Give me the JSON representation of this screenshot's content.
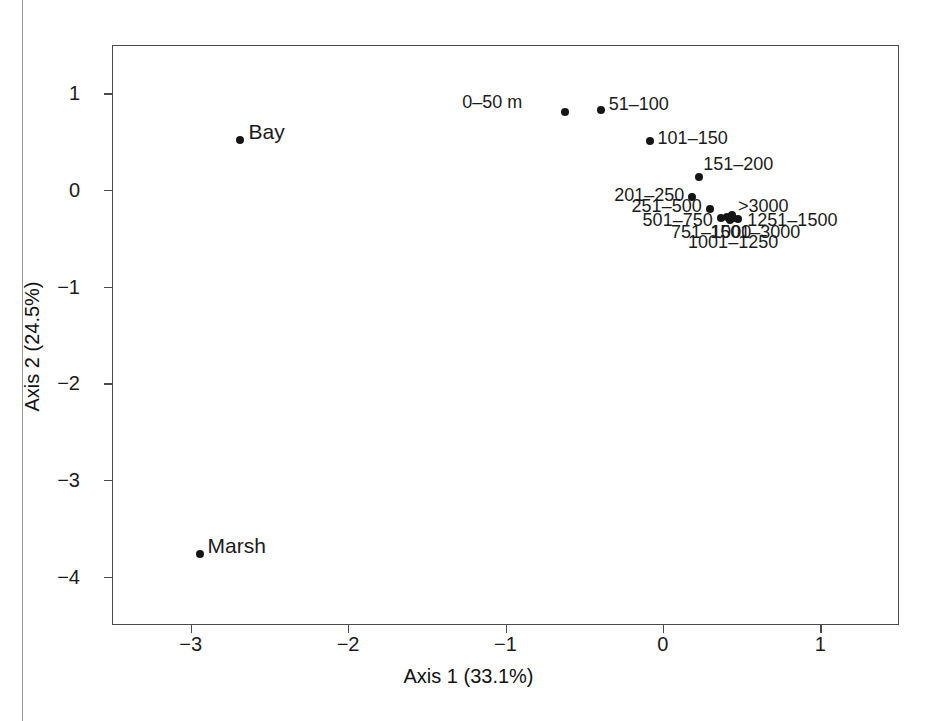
{
  "figure": {
    "background_color": "#ffffff",
    "frame_color": "#4a4a4a",
    "point_color": "#151515"
  },
  "chart_data": {
    "type": "scatter",
    "title": "",
    "xlabel": "Axis 1 (33.1%)",
    "ylabel": "Axis 2 (24.5%)",
    "xlim": [
      -3.5,
      1.5
    ],
    "ylim": [
      -4.5,
      1.5
    ],
    "xticks": [
      -3,
      -2,
      -1,
      0,
      1
    ],
    "xticklabels": [
      "−3",
      "−2",
      "−1",
      "0",
      "1"
    ],
    "yticks": [
      1,
      0,
      -1,
      -2,
      -3,
      -4
    ],
    "yticklabels": [
      "1",
      "0",
      "−1",
      "−2",
      "−3",
      "−4"
    ],
    "grid": false,
    "legend": false,
    "points": [
      {
        "label": "Bay",
        "x": -2.69,
        "y": 0.53,
        "label_pos": "right"
      },
      {
        "label": "Marsh",
        "x": -2.95,
        "y": -3.76,
        "label_pos": "right"
      },
      {
        "label": "0–50 m",
        "x": -0.63,
        "y": 0.82,
        "label_pos": "left"
      },
      {
        "label": "51–100",
        "x": -0.4,
        "y": 0.84,
        "label_pos": "right"
      },
      {
        "label": "101–150",
        "x": -0.09,
        "y": 0.52,
        "label_pos": "right"
      },
      {
        "label": "151–200",
        "x": 0.22,
        "y": 0.14,
        "label_pos": "right"
      },
      {
        "label": "201–250",
        "x": 0.18,
        "y": -0.06,
        "label_pos": "left"
      },
      {
        "label": "251–500",
        "x": 0.29,
        "y": -0.19,
        "label_pos": "left"
      },
      {
        "label": "501–750",
        "x": 0.36,
        "y": -0.28,
        "label_pos": "left"
      },
      {
        "label": "751–1000",
        "x": 0.4,
        "y": -0.27,
        "label_pos": "below-left"
      },
      {
        "label": "1001–1250",
        "x": 0.42,
        "y": -0.3,
        "label_pos": "below"
      },
      {
        "label": "1251–1500",
        "x": 0.47,
        "y": -0.29,
        "label_pos": "right"
      },
      {
        "label": "1501–3000",
        "x": 0.44,
        "y": -0.28,
        "label_pos": "below-right"
      },
      {
        "label": ">3000",
        "x": 0.43,
        "y": -0.25,
        "label_pos": "above-right"
      }
    ],
    "annotations": [
      {
        "text": "0–50 m",
        "x": -0.9,
        "y": 0.92
      },
      {
        "text": "51–100",
        "x": -0.35,
        "y": 0.9
      },
      {
        "text": "101–150",
        "x": -0.04,
        "y": 0.55
      },
      {
        "text": "151–200",
        "x": 0.25,
        "y": 0.28
      },
      {
        "text": "201–250",
        "x": 0.13,
        "y": -0.04
      },
      {
        "text": "251–500",
        "x": 0.24,
        "y": -0.16
      },
      {
        "text": ">3000",
        "x": 0.47,
        "y": -0.16
      },
      {
        "text": "501–750",
        "x": 0.31,
        "y": -0.3
      },
      {
        "text": "1251–1500",
        "x": 0.53,
        "y": -0.3
      },
      {
        "text": "751–1000",
        "x": 0.3,
        "y": -0.42
      },
      {
        "text": "1501–3000",
        "x": 0.58,
        "y": -0.42
      },
      {
        "text": "1001–1250",
        "x": 0.44,
        "y": -0.53
      }
    ]
  },
  "caption_fragment": ""
}
